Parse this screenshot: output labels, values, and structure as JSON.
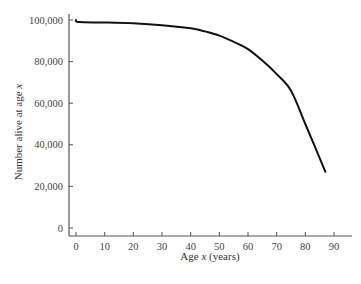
{
  "chart_data": {
    "type": "line",
    "title": "",
    "xlabel": "Age x (years)",
    "ylabel": "Number alive at age x",
    "xlim": [
      0,
      95
    ],
    "ylim": [
      0,
      100000
    ],
    "x_ticks": [
      0,
      10,
      20,
      30,
      40,
      50,
      60,
      70,
      80,
      90
    ],
    "x_tick_labels": [
      "0",
      "10",
      "20",
      "30",
      "40",
      "50",
      "60",
      "70",
      "80",
      "90"
    ],
    "y_ticks": [
      0,
      20000,
      40000,
      60000,
      80000,
      100000
    ],
    "y_tick_labels": [
      "0",
      "20,000",
      "40,000",
      "60,000",
      "80,000",
      "100,000"
    ],
    "grid": false,
    "legend": null,
    "series": [
      {
        "name": "Survivorship",
        "color": "#111111",
        "x": [
          0,
          1,
          10,
          20,
          30,
          40,
          45,
          50,
          55,
          60,
          65,
          70,
          75,
          80,
          87
        ],
        "y": [
          100000,
          99000,
          98800,
          98400,
          97500,
          96000,
          94500,
          92500,
          89500,
          86000,
          80500,
          74000,
          66000,
          50000,
          27000
        ]
      }
    ]
  }
}
